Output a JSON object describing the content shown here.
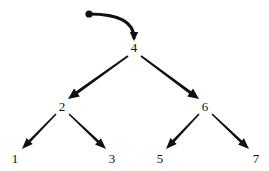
{
  "diagram": {
    "background_color": "#ffffff",
    "ink_color": "#111111",
    "root_pointer": {
      "dot_label": "",
      "dot": {
        "x": 89,
        "y": 14,
        "r": 3.6
      },
      "curve": {
        "from_x": 89,
        "from_y": 14,
        "ctrl_x": 134,
        "ctrl_y": 14,
        "to_x": 134,
        "to_y": 38
      },
      "arrow_target": "4"
    },
    "nodes": [
      {
        "id": "n4",
        "label": "4",
        "x": 134,
        "y": 47,
        "level": 0
      },
      {
        "id": "n2",
        "label": "2",
        "x": 62,
        "y": 106,
        "level": 1
      },
      {
        "id": "n6",
        "label": "6",
        "x": 205,
        "y": 106,
        "level": 1
      },
      {
        "id": "n1",
        "label": "1",
        "x": 15,
        "y": 158,
        "level": 2
      },
      {
        "id": "n3",
        "label": "3",
        "x": 112,
        "y": 158,
        "level": 2
      },
      {
        "id": "n5",
        "label": "5",
        "x": 160,
        "y": 158,
        "level": 2
      },
      {
        "id": "n7",
        "label": "7",
        "x": 256,
        "y": 158,
        "level": 2
      }
    ],
    "edges": [
      {
        "id": "e4-2",
        "from": "4",
        "to": "2",
        "x1": 128,
        "y1": 56,
        "x2": 68,
        "y2": 99,
        "width": 3.0
      },
      {
        "id": "e4-6",
        "from": "4",
        "to": "6",
        "x1": 141,
        "y1": 56,
        "x2": 199,
        "y2": 99,
        "width": 3.0
      },
      {
        "id": "e2-1",
        "from": "2",
        "to": "1",
        "x1": 56,
        "y1": 114,
        "x2": 22,
        "y2": 149,
        "width": 2.6
      },
      {
        "id": "e2-3",
        "from": "2",
        "to": "3",
        "x1": 69,
        "y1": 114,
        "x2": 106,
        "y2": 149,
        "width": 2.6
      },
      {
        "id": "e6-5",
        "from": "6",
        "to": "5",
        "x1": 199,
        "y1": 114,
        "x2": 166,
        "y2": 149,
        "width": 2.6
      },
      {
        "id": "e6-7",
        "from": "6",
        "to": "7",
        "x1": 212,
        "y1": 114,
        "x2": 249,
        "y2": 149,
        "width": 2.6
      }
    ]
  }
}
